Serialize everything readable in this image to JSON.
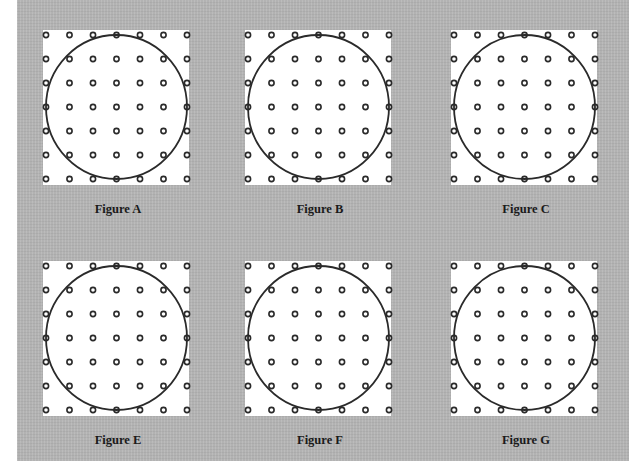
{
  "page": {
    "colors": {
      "panel_background": "#b5b5b5",
      "figure_background": "#ffffff",
      "stroke": "#2a2a2a"
    }
  },
  "figures": [
    {
      "id": "A",
      "label": "Figure A"
    },
    {
      "id": "B",
      "label": "Figure B"
    },
    {
      "id": "C",
      "label": "Figure C"
    },
    {
      "id": "E",
      "label": "Figure E"
    },
    {
      "id": "F",
      "label": "Figure F"
    },
    {
      "id": "G",
      "label": "Figure G"
    }
  ],
  "grid": {
    "rows": 7,
    "columns": 7,
    "dot_shape": "ring",
    "overlay_shape": "inscribed-circle"
  }
}
